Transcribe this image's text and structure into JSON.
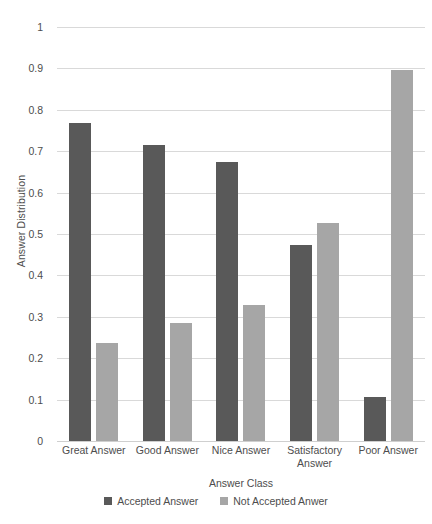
{
  "chart_data": {
    "type": "bar",
    "title": "",
    "xlabel": "Answer Class",
    "ylabel": "Answer Distribution",
    "categories": [
      "Great Answer",
      "Good Answer",
      "Nice Answer",
      "Satisfactory Answer",
      "Poor Answer"
    ],
    "series": [
      {
        "name": "Accepted Answer",
        "color": "#595959",
        "values": [
          0.767,
          0.714,
          0.674,
          0.473,
          0.107
        ]
      },
      {
        "name": "Not Accepted Anwer",
        "color": "#a6a6a6",
        "values": [
          0.236,
          0.286,
          0.329,
          0.527,
          0.895
        ]
      }
    ],
    "ylim": [
      0,
      1
    ],
    "ytick_labels": [
      "0",
      "0.1",
      "0.2",
      "0.3",
      "0.4",
      "0.5",
      "0.6",
      "0.7",
      "0.8",
      "0.9",
      "1"
    ],
    "ytick_values": [
      0,
      0.1,
      0.2,
      0.3,
      0.4,
      0.5,
      0.6,
      0.7,
      0.8,
      0.9,
      1
    ],
    "grid": true,
    "grid_color": "#d9d9d9",
    "legend_position": "bottom",
    "background": "#ffffff"
  }
}
